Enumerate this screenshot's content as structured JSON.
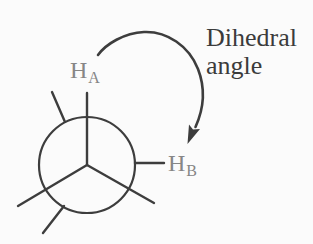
{
  "figure": {
    "type": "newman-projection-diagram",
    "background": "#fbfbfb",
    "colors": {
      "bond": "#3d3d3d",
      "arrow": "#3d3d3d",
      "atom_label": "#868686",
      "caption_text": "#3b3b3b"
    },
    "atoms": {
      "front_top": {
        "symbol": "H",
        "subscript": "A"
      },
      "back_right": {
        "symbol": "H",
        "subscript": "B"
      }
    },
    "caption": {
      "line1": "Dihedral",
      "line2": "angle"
    }
  }
}
